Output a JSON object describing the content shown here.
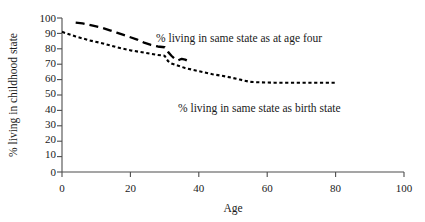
{
  "chart_data": {
    "type": "line",
    "title": "",
    "xlabel": "Age",
    "ylabel": "% living in childhood state",
    "xlim": [
      0,
      100
    ],
    "ylim": [
      0,
      100
    ],
    "xticks": [
      0,
      20,
      40,
      60,
      80,
      100
    ],
    "yticks": [
      0,
      10,
      20,
      30,
      40,
      50,
      60,
      70,
      80,
      90,
      100
    ],
    "grid": false,
    "legend_position": "inline-annotations",
    "series": [
      {
        "name": "% living in same state as at age four",
        "style": "long-dash",
        "color": "#000000",
        "x": [
          4,
          6,
          8,
          10,
          12,
          14,
          16,
          18,
          20,
          22,
          24,
          26,
          28,
          30,
          31,
          32,
          33,
          34,
          35,
          36,
          37
        ],
        "y": [
          97,
          96.5,
          95.5,
          94.5,
          93.5,
          92,
          90.5,
          89,
          87.5,
          86,
          84,
          82.5,
          81.5,
          81,
          78,
          75.5,
          73.5,
          72.5,
          73.5,
          73,
          72
        ]
      },
      {
        "name": "% living in same state as birth state",
        "style": "fine-dot",
        "color": "#000000",
        "x": [
          0,
          4,
          8,
          12,
          16,
          20,
          24,
          28,
          30,
          31,
          32,
          34,
          36,
          40,
          44,
          48,
          52,
          55,
          58,
          62,
          66,
          70,
          74,
          78,
          80
        ],
        "y": [
          91,
          88,
          85.5,
          83.5,
          81,
          79,
          77.5,
          76,
          75.5,
          72,
          70.5,
          69,
          67.5,
          65.5,
          63.5,
          62,
          60,
          58.5,
          58.2,
          58,
          58,
          58,
          58,
          58,
          58
        ]
      }
    ],
    "annotations": [
      {
        "name": "age-four-series-label",
        "text": "% living in same state as at age four",
        "x_px": 156,
        "y_px": 42
      },
      {
        "name": "birth-state-series-label",
        "text": "% living in same state as birth state",
        "x_px": 178,
        "y_px": 112
      }
    ]
  },
  "axes": {
    "y_title": "% living in childhood state",
    "x_title": "Age",
    "y_tick_labels": [
      "100",
      "90",
      "80",
      "70",
      "60",
      "50",
      "40",
      "30",
      "20",
      "10",
      "0"
    ],
    "x_tick_labels": [
      "0",
      "20",
      "40",
      "60",
      "80",
      "100"
    ]
  }
}
